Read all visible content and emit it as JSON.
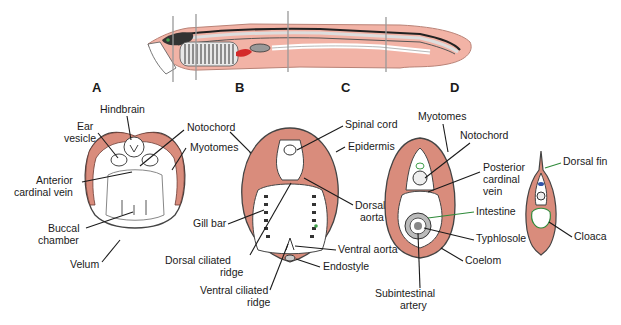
{
  "figure": {
    "section_letters": [
      "A",
      "B",
      "C",
      "D"
    ],
    "colors": {
      "muscle": "#d98c7c",
      "muscle_line": "#a0574a",
      "outline": "#333333",
      "body_pink": "#f2b3a6",
      "blood_red": "#d42a2a",
      "green_accent": "#2f8a3a",
      "cut_line": "#999999"
    }
  },
  "section_a": {
    "letter": "A",
    "labels": {
      "hindbrain": "Hindbrain",
      "ear_vesicle_1": "Ear",
      "ear_vesicle_2": "vesicle",
      "notochord": "Notochord",
      "myotomes": "Myotomes",
      "anterior_cardinal_1": "Anterior",
      "anterior_cardinal_2": "cardinal vein",
      "buccal_1": "Buccal",
      "buccal_2": "chamber",
      "velum": "Velum"
    }
  },
  "section_b": {
    "letter": "B",
    "labels": {
      "spinal_cord": "Spinal cord",
      "epidermis": "Epidermis",
      "dorsal_aorta_1": "Dorsal",
      "dorsal_aorta_2": "aorta",
      "gill_bar": "Gill bar",
      "ventral_aorta": "Ventral aorta",
      "dorsal_ciliated_1": "Dorsal ciliated",
      "dorsal_ciliated_2": "ridge",
      "endostyle": "Endostyle",
      "ventral_ciliated_1": "Ventral ciliated",
      "ventral_ciliated_2": "ridge"
    }
  },
  "section_c": {
    "letter": "C",
    "labels": {
      "myotomes": "Myotomes",
      "notochord": "Notochord",
      "posterior_cardinal_1": "Posterior",
      "posterior_cardinal_2": "cardinal",
      "posterior_cardinal_3": "vein",
      "intestine": "Intestine",
      "typhlosole": "Typhlosole",
      "coelom": "Coelom",
      "subintestinal_1": "Subintestinal",
      "subintestinal_2": "artery"
    }
  },
  "section_d": {
    "letter": "D",
    "labels": {
      "dorsal_fin": "Dorsal fin",
      "cloaca": "Cloaca"
    }
  }
}
